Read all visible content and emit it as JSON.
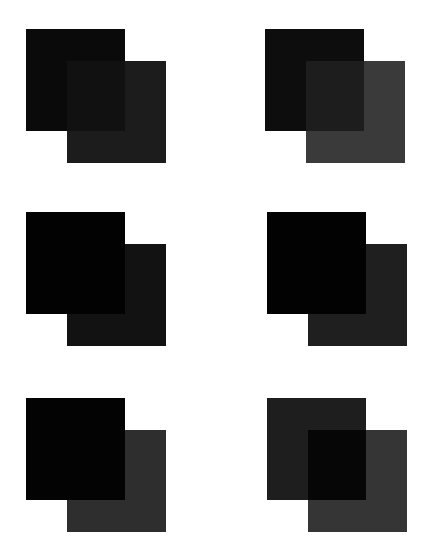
{
  "pairs": [
    {
      "id": "top-left",
      "position": {
        "left": 26,
        "top": 29
      },
      "square_a": {
        "color": "#0a0a0a"
      },
      "square_b": {
        "color": "#1c1c1c"
      },
      "overlap": {
        "color": "#111111"
      },
      "front": "a"
    },
    {
      "id": "top-right",
      "position": {
        "left": 265,
        "top": 29
      },
      "square_a": {
        "color": "#0d0d0d"
      },
      "square_b": {
        "color": "#3a3a3a"
      },
      "overlap": {
        "color": "#1d1d1d"
      },
      "front": "overlap"
    },
    {
      "id": "middle-left",
      "position": {
        "left": 26,
        "top": 212
      },
      "square_a": {
        "color": "#020202"
      },
      "square_b": {
        "color": "#121212"
      },
      "overlap": {
        "color": "#020202"
      },
      "front": "a"
    },
    {
      "id": "middle-right",
      "position": {
        "left": 267,
        "top": 212
      },
      "square_a": {
        "color": "#020202"
      },
      "square_b": {
        "color": "#1f1f1f"
      },
      "overlap": {
        "color": "#020202"
      },
      "front": "a"
    },
    {
      "id": "bottom-left",
      "position": {
        "left": 26,
        "top": 398
      },
      "square_a": {
        "color": "#030303"
      },
      "square_b": {
        "color": "#2e2e2e"
      },
      "overlap": {
        "color": "#030303"
      },
      "front": "a"
    },
    {
      "id": "bottom-right",
      "position": {
        "left": 267,
        "top": 398
      },
      "square_a": {
        "color": "#1e1e1e"
      },
      "square_b": {
        "color": "#353535"
      },
      "overlap": {
        "color": "#060606"
      },
      "front": "overlap"
    }
  ]
}
